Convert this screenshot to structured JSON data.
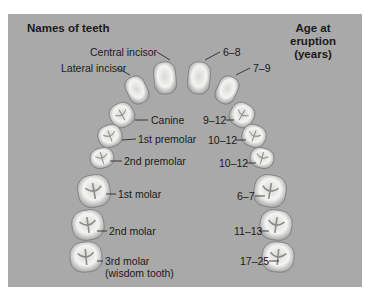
{
  "title_left": "Names of teeth",
  "title_right_line1": "Age at eruption",
  "title_right_line2": "(years)",
  "colors": {
    "panel": "#a9a9a9",
    "text": "#1a1a1a",
    "tooth": "#f2f2f0"
  },
  "teeth": [
    {
      "name": "Central incisor",
      "age": "6–8"
    },
    {
      "name": "Lateral incisor",
      "age": "7–9"
    },
    {
      "name": "Canine",
      "age": "9–12"
    },
    {
      "name": "1st premolar",
      "age": "10–12"
    },
    {
      "name": "2nd premolar",
      "age": "10–12"
    },
    {
      "name": "1st molar",
      "age": "6–7"
    },
    {
      "name": "2nd molar",
      "age": "11–13"
    },
    {
      "name": "3rd molar",
      "name_line2": "(wisdom tooth)",
      "age": "17–25"
    }
  ]
}
